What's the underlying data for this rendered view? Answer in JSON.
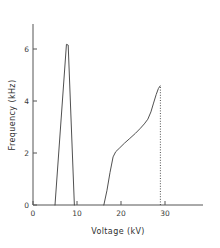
{
  "chart_data": {
    "type": "line",
    "title": "",
    "xlabel": "Voltage  (kV)",
    "ylabel": "Frequency  (kHz)",
    "xlim": [
      0,
      35
    ],
    "ylim": [
      0,
      7
    ],
    "xticks": [
      0,
      10,
      20,
      30
    ],
    "xticklabels": [
      "0",
      "10",
      "20",
      "30"
    ],
    "yticks": [
      0,
      2,
      4,
      6
    ],
    "yticklabels": [
      "0",
      "2",
      "4",
      "6"
    ],
    "grid": false,
    "legend": "none",
    "series": [
      {
        "name": "first-mode-peak",
        "style": "solid",
        "points": [
          [
            5.0,
            0.0
          ],
          [
            7.6,
            6.18
          ],
          [
            8.0,
            6.15
          ],
          [
            9.4,
            0.0
          ]
        ]
      },
      {
        "name": "second-mode-branch",
        "style": "solid",
        "points": [
          [
            16.1,
            0.0
          ],
          [
            16.8,
            0.55
          ],
          [
            17.5,
            1.25
          ],
          [
            18.2,
            1.85
          ],
          [
            18.8,
            2.05
          ],
          [
            19.6,
            2.18
          ],
          [
            20.8,
            2.38
          ],
          [
            22.0,
            2.56
          ],
          [
            23.3,
            2.76
          ],
          [
            24.4,
            2.95
          ],
          [
            25.3,
            3.12
          ],
          [
            26.1,
            3.3
          ],
          [
            26.8,
            3.58
          ],
          [
            27.4,
            3.92
          ],
          [
            28.0,
            4.25
          ],
          [
            28.5,
            4.48
          ],
          [
            28.9,
            4.58
          ]
        ]
      }
    ],
    "annotations": [
      {
        "name": "cutoff-dotted-line",
        "style": "dotted",
        "x": 28.95,
        "y_from": 0.0,
        "y_to": 4.58
      }
    ]
  },
  "axis_titles": {
    "x": "Voltage  (kV)",
    "y": "Frequency  (kHz)"
  }
}
